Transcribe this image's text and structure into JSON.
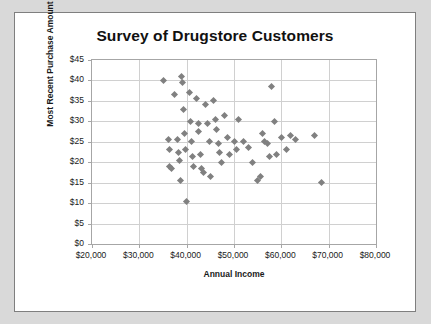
{
  "chart_data": {
    "type": "scatter",
    "title": "Survey of Drugstore Customers",
    "xlabel": "Annual Income",
    "ylabel": "Most Recent Purchase Amount",
    "xlim": [
      20000,
      80000
    ],
    "ylim": [
      0,
      45
    ],
    "grid": true,
    "legend": null,
    "xticks": [
      "$20,000",
      "$30,000",
      "$40,000",
      "$50,000",
      "$60,000",
      "$70,000",
      "$80,000"
    ],
    "xtick_values": [
      20000,
      30000,
      40000,
      50000,
      60000,
      70000,
      80000
    ],
    "yticks": [
      "$0",
      "$5",
      "$10",
      "$15",
      "$20",
      "$25",
      "$30",
      "$35",
      "$40",
      "$45"
    ],
    "ytick_values": [
      0,
      5,
      10,
      15,
      20,
      25,
      30,
      35,
      40,
      45
    ],
    "marker": "diamond",
    "marker_color": "#808080",
    "points": [
      [
        35000,
        40.0
      ],
      [
        36200,
        25.5
      ],
      [
        36300,
        23.0
      ],
      [
        36400,
        19.0
      ],
      [
        36800,
        18.5
      ],
      [
        37500,
        36.5
      ],
      [
        38000,
        25.5
      ],
      [
        38200,
        22.5
      ],
      [
        38400,
        20.5
      ],
      [
        38600,
        15.5
      ],
      [
        39000,
        41.0
      ],
      [
        39200,
        39.5
      ],
      [
        39400,
        33.0
      ],
      [
        39600,
        27.0
      ],
      [
        39800,
        23.0
      ],
      [
        40000,
        10.5
      ],
      [
        40500,
        37.0
      ],
      [
        40800,
        30.0
      ],
      [
        41000,
        25.0
      ],
      [
        41200,
        21.5
      ],
      [
        41400,
        19.0
      ],
      [
        42000,
        35.5
      ],
      [
        42400,
        29.5
      ],
      [
        42600,
        27.5
      ],
      [
        43000,
        22.0
      ],
      [
        43200,
        18.5
      ],
      [
        43600,
        17.5
      ],
      [
        44000,
        34.0
      ],
      [
        44400,
        29.5
      ],
      [
        44800,
        25.0
      ],
      [
        45000,
        16.5
      ],
      [
        45600,
        35.0
      ],
      [
        46000,
        30.5
      ],
      [
        46400,
        28.0
      ],
      [
        46800,
        24.5
      ],
      [
        47000,
        22.5
      ],
      [
        47400,
        20.0
      ],
      [
        48000,
        31.5
      ],
      [
        48600,
        26.0
      ],
      [
        49000,
        22.0
      ],
      [
        50000,
        25.0
      ],
      [
        50500,
        23.0
      ],
      [
        51000,
        30.5
      ],
      [
        52000,
        25.0
      ],
      [
        53000,
        23.5
      ],
      [
        54000,
        20.0
      ],
      [
        55000,
        15.5
      ],
      [
        55500,
        16.5
      ],
      [
        56000,
        27.0
      ],
      [
        56500,
        25.0
      ],
      [
        57000,
        24.5
      ],
      [
        57500,
        21.5
      ],
      [
        58000,
        38.5
      ],
      [
        58500,
        30.0
      ],
      [
        59000,
        22.0
      ],
      [
        60000,
        26.0
      ],
      [
        61000,
        23.0
      ],
      [
        62000,
        26.5
      ],
      [
        63000,
        25.5
      ],
      [
        67000,
        26.5
      ],
      [
        68500,
        15.0
      ]
    ]
  }
}
